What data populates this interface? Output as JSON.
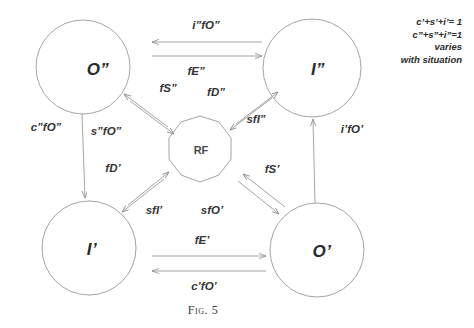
{
  "figure": {
    "caption": "Fig. 5",
    "stroke_color": "#8a8a8a",
    "text_color": "#2b2b2b",
    "background": "#ffffff"
  },
  "nodes": [
    {
      "id": "O2",
      "label": "O”",
      "shape": "circle",
      "cx": 83,
      "cy": 67,
      "r": 47
    },
    {
      "id": "I2",
      "label": "I”",
      "shape": "circle",
      "cx": 312,
      "cy": 68,
      "r": 49
    },
    {
      "id": "I1",
      "label": "I’",
      "shape": "circle",
      "cx": 89,
      "cy": 248,
      "r": 47
    },
    {
      "id": "O1",
      "label": "O’",
      "shape": "circle",
      "cx": 317,
      "cy": 250,
      "r": 47
    },
    {
      "id": "RF",
      "label": "RF",
      "shape": "polygon",
      "cx": 200,
      "cy": 149,
      "r": 33
    }
  ],
  "edges": [
    {
      "id": "i2fO2",
      "label": "i”fO”",
      "from": "I2",
      "to": "O2",
      "direction": "left",
      "label_x": 206,
      "label_y": 25
    },
    {
      "id": "fE2",
      "label": "fE”",
      "from": "O2",
      "to": "I2",
      "direction": "right",
      "label_x": 196,
      "label_y": 71
    },
    {
      "id": "fS2",
      "label": "fS”",
      "from": "RF",
      "to": "O2",
      "direction": "up-left",
      "label_x": 168,
      "label_y": 88
    },
    {
      "id": "s2fO2",
      "label": "s”fO”",
      "from": "O2",
      "to": "RF",
      "direction": "down-right",
      "label_x": 106,
      "label_y": 131
    },
    {
      "id": "fD2",
      "label": "fD”",
      "from": "I2",
      "to": "RF",
      "direction": "down-left",
      "label_x": 216,
      "label_y": 92
    },
    {
      "id": "sfI2",
      "label": "sfI”",
      "from": "RF",
      "to": "I2",
      "direction": "up-right",
      "label_x": 256,
      "label_y": 119
    },
    {
      "id": "c2fO2",
      "label": "c”fO”",
      "from": "O2",
      "to": "I1",
      "direction": "down",
      "label_x": 46,
      "label_y": 127
    },
    {
      "id": "i1fO1",
      "label": "i’fO’",
      "from": "O1",
      "to": "I2",
      "direction": "up",
      "label_x": 352,
      "label_y": 129
    },
    {
      "id": "fD1",
      "label": "fD’",
      "from": "I1",
      "to": "RF",
      "direction": "up-right",
      "label_x": 113,
      "label_y": 168
    },
    {
      "id": "sfI1",
      "label": "sfI’",
      "from": "RF",
      "to": "I1",
      "direction": "down-left",
      "label_x": 154,
      "label_y": 210
    },
    {
      "id": "sfO1",
      "label": "sfO’",
      "from": "RF",
      "to": "O1",
      "direction": "down-right",
      "label_x": 212,
      "label_y": 210
    },
    {
      "id": "fS1",
      "label": "fS’",
      "from": "O1",
      "to": "RF",
      "direction": "up-left",
      "label_x": 272,
      "label_y": 169
    },
    {
      "id": "fE1",
      "label": "fE’",
      "from": "I1",
      "to": "O1",
      "direction": "right",
      "label_x": 202,
      "label_y": 240
    },
    {
      "id": "c1fO1",
      "label": "c’fO’",
      "from": "O1",
      "to": "I1",
      "direction": "left",
      "label_x": 204,
      "label_y": 286
    }
  ],
  "annotation": {
    "line1": "c’+s’+i’= 1",
    "line2": "c”+s”+i”=1",
    "line3": "varies",
    "line4": "with situation"
  }
}
